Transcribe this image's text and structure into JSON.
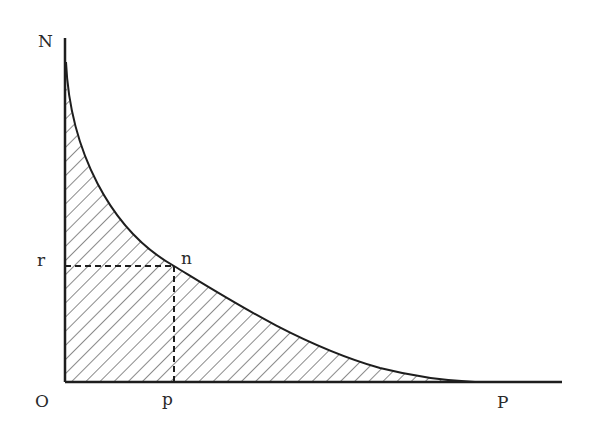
{
  "diagram": {
    "type": "curve-with-shaded-area",
    "labels": {
      "y_axis_top": "N",
      "y_level": "r",
      "curve_point": "n",
      "origin": "O",
      "x_point": "p",
      "x_end": "P"
    },
    "colors": {
      "ink": "#1e1e1e",
      "background": "#ffffff"
    }
  }
}
